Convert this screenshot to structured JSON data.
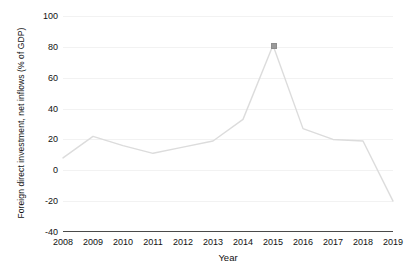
{
  "chart_data": {
    "type": "line",
    "title": "",
    "xlabel": "Year",
    "ylabel": "Foreign direct investment, net inflows (% of GDP)",
    "categories": [
      "2008",
      "2009",
      "2010",
      "2011",
      "2012",
      "2013",
      "2014",
      "2015",
      "2016",
      "2017",
      "2018",
      "2019"
    ],
    "x": [
      2008,
      2009,
      2010,
      2011,
      2012,
      2013,
      2014,
      2015,
      2016,
      2017,
      2018,
      2019
    ],
    "values": [
      8,
      22,
      16,
      11,
      15,
      19,
      33,
      81,
      27,
      20,
      19,
      -20
    ],
    "series": [
      {
        "name": "Foreign direct investment, net inflows (% of GDP)",
        "values": [
          8,
          22,
          16,
          11,
          15,
          19,
          33,
          81,
          27,
          20,
          19,
          -20
        ]
      }
    ],
    "ylim": [
      -40,
      100
    ],
    "xlim": [
      2008,
      2019
    ],
    "yticks": [
      -40,
      -20,
      0,
      20,
      40,
      60,
      80,
      100
    ],
    "ytick_labels": [
      "-40",
      "-20",
      "0",
      "20",
      "40",
      "60",
      "80",
      "100"
    ],
    "xticks": [
      2008,
      2009,
      2010,
      2011,
      2012,
      2013,
      2014,
      2015,
      2016,
      2017,
      2018,
      2019
    ],
    "xtick_labels": [
      "2008",
      "2009",
      "2010",
      "2011",
      "2012",
      "2013",
      "2014",
      "2015",
      "2016",
      "2017",
      "2018",
      "2019"
    ],
    "grid": true,
    "grid_axis": "y",
    "legend": false,
    "legend_position": "none",
    "markers": [
      {
        "x": 2015,
        "y": 81,
        "label": "peak"
      }
    ],
    "annotations": [],
    "colors": {
      "line": "#dcdcdc",
      "grid": "#f2f2f2",
      "axis": "#4a4a4a",
      "text": "#111111",
      "marker": "#9a9a9a",
      "background": "#ffffff"
    }
  }
}
